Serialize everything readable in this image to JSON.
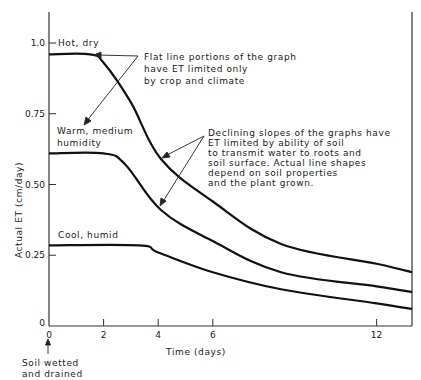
{
  "chart_data": {
    "type": "line",
    "title": "",
    "xlabel": "Time (days)",
    "ylabel": "Actual ET (cm/day)",
    "xlim": [
      0,
      13.3
    ],
    "ylim": [
      0,
      1.1
    ],
    "xticks": [
      "0",
      "2",
      "4",
      "6",
      "12"
    ],
    "yticks": [
      "0",
      "0.25",
      "0.50",
      "0.75",
      "1.0"
    ],
    "grid": false,
    "series": [
      {
        "name": "Hot, dry",
        "x": [
          0,
          1.5,
          2.0,
          3.0,
          4.1,
          6.0,
          8.5,
          12.0,
          13.3
        ],
        "values": [
          0.96,
          0.96,
          0.93,
          0.79,
          0.59,
          0.44,
          0.29,
          0.22,
          0.19
        ]
      },
      {
        "name": "Warm, medium humidity",
        "x": [
          0,
          2.0,
          2.8,
          4.1,
          6.0,
          8.5,
          12.0,
          13.3
        ],
        "values": [
          0.61,
          0.61,
          0.57,
          0.41,
          0.3,
          0.19,
          0.14,
          0.12
        ]
      },
      {
        "name": "Cool, humid",
        "x": [
          0,
          3.3,
          4.0,
          6.0,
          8.5,
          12.0,
          13.3
        ],
        "values": [
          0.285,
          0.285,
          0.26,
          0.19,
          0.13,
          0.08,
          0.06
        ]
      }
    ],
    "annotations": [
      "Flat line portions of the graph have ET limited only by crop and climate",
      "Declining slopes of the graphs have ET limited by ability of soil to transmit water to roots and soil surface. Actual line shapes depend on soil properties and the plant grown.",
      "Soil wetted and drained"
    ]
  },
  "labels": {
    "series_hot": "Hot, dry",
    "series_warm_1": "Warm, medium",
    "series_warm_2": "humidity",
    "series_cool": "Cool, humid",
    "note_flat": [
      "Flat line portions of the graph",
      "have ET limited only",
      "by crop and climate"
    ],
    "note_decline": [
      "Declining slopes of the graphs have",
      "ET limited by ability of soil",
      "to transmit water to roots and",
      "soil surface. Actual line shapes",
      "depend on soil properties",
      "and the plant grown."
    ],
    "note_soil": [
      "Soil wetted",
      "and drained"
    ],
    "xlabel": "Time (days)",
    "ylabel": "Actual ET (cm/day)",
    "origin": "0"
  },
  "colors": {
    "line": "#111111",
    "axis": "#333333",
    "background": "#ffffff"
  }
}
